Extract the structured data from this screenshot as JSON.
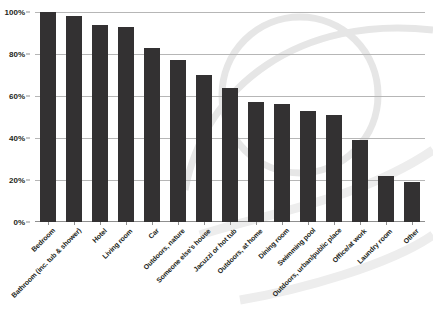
{
  "chart_data": {
    "type": "bar",
    "title": "",
    "subtitle": "",
    "xlabel": "",
    "ylabel": "",
    "ylim": [
      0,
      100
    ],
    "yticks": [
      "0%",
      "20%",
      "40%",
      "60%",
      "80%",
      "100%"
    ],
    "ytick_values": [
      0,
      20,
      40,
      60,
      80,
      100
    ],
    "grid": true,
    "legend": null,
    "value_suffix": "%",
    "categories": [
      "Bedroom",
      "Bathroom (inc. tub & shower)",
      "Hotel",
      "Living room",
      "Car",
      "Outdoors, nature",
      "Someone else's house",
      "Jacuzzi or hot tub",
      "Outdoors, at home",
      "Dining room",
      "Swimming pool",
      "Outdoors, urban/public place",
      "Office/at work",
      "Laundry room",
      "Other"
    ],
    "values": [
      100,
      98,
      94,
      93,
      83,
      77,
      70,
      64,
      57,
      56,
      53,
      51,
      39,
      22,
      19
    ]
  },
  "style": {
    "bar_color": "#333132",
    "grid_color": "#b6b6b6",
    "axis_color": "#8f8f8f",
    "text_color": "#231f20",
    "background": "#ffffff",
    "watermark_color": "#e8e8e8"
  }
}
